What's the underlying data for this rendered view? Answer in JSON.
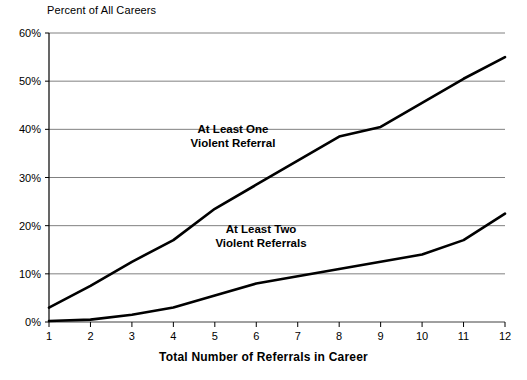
{
  "chart_data": {
    "type": "line",
    "title": "",
    "xlabel": "Total Number of Referrals in Career",
    "ylabel": "Percent of All Careers",
    "x": [
      1,
      2,
      3,
      4,
      5,
      6,
      7,
      8,
      9,
      10,
      11,
      12
    ],
    "xlim": [
      1,
      12
    ],
    "ylim": [
      0,
      60
    ],
    "grid": true,
    "legend_position": "inline-annotations",
    "x_tick_labels": [
      "1",
      "2",
      "3",
      "4",
      "5",
      "6",
      "7",
      "8",
      "9",
      "10",
      "11",
      "12"
    ],
    "y_tick_labels": [
      "0%",
      "10%",
      "20%",
      "30%",
      "40%",
      "50%",
      "60%"
    ],
    "y_ticks": [
      0,
      10,
      20,
      30,
      40,
      50,
      60
    ],
    "series": [
      {
        "name": "At Least One Violent Referral",
        "annotation_lines": [
          "At Least One",
          "Violent Referral"
        ],
        "color": "#000000",
        "values": [
          3,
          7.5,
          12.5,
          17,
          23.5,
          28.5,
          33.5,
          38.5,
          40.5,
          45.5,
          50.5,
          55
        ]
      },
      {
        "name": "At Least Two Violent Referrals",
        "annotation_lines": [
          "At Least Two",
          "Violent Referrals"
        ],
        "color": "#000000",
        "values": [
          0.2,
          0.5,
          1.5,
          3,
          5.5,
          8,
          9.5,
          11,
          12.5,
          14,
          17,
          22.5
        ]
      }
    ]
  },
  "axis": {
    "y_title": "Percent of All Careers",
    "x_title": "Total Number of Referrals in Career"
  },
  "colors": {
    "grid": "#808080",
    "axis": "#000000",
    "series": "#000000",
    "background": "#ffffff"
  }
}
